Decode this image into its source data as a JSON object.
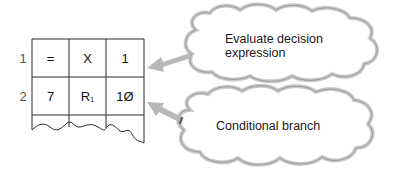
{
  "memory_table": {
    "rows": [
      {
        "label": "1",
        "cells": [
          "=",
          "X",
          "1"
        ]
      },
      {
        "label": "2",
        "cells": [
          "7",
          "R",
          "1Ø"
        ],
        "subscript": "1"
      }
    ]
  },
  "callouts": [
    {
      "line1": "Evaluate decision",
      "line2": "expression",
      "points_to_row": "1"
    },
    {
      "line1": "Conditional branch",
      "points_to_row": "2"
    }
  ],
  "colors": {
    "grid_line": "#2a2a2a",
    "cloud_outline": "#9a9a9a",
    "cloud_shadow": "#c8c8c8",
    "arrow": "#b5b5b5"
  }
}
